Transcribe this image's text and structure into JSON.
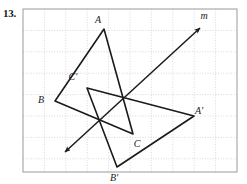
{
  "problem": {
    "number": "13."
  },
  "figure": {
    "frame": {
      "x": 23,
      "y": 9,
      "width": 214,
      "height": 163,
      "border_color": "#9a9a9a"
    },
    "grid": {
      "spacing": 21.4,
      "color": "#c9c9c9",
      "style": "dotted",
      "visible": true
    },
    "background_color": "#ffffff",
    "ink_color": "#1a1a1a",
    "labels": [
      {
        "id": "A",
        "text": "A",
        "x": 98,
        "y": 23
      },
      {
        "id": "B",
        "text": "B",
        "x": 41,
        "y": 103
      },
      {
        "id": "C",
        "text": "C",
        "x": 137,
        "y": 147
      },
      {
        "id": "Ap",
        "text": "A'",
        "x": 199,
        "y": 114
      },
      {
        "id": "Bp",
        "text": "B'",
        "x": 114,
        "y": 181
      },
      {
        "id": "Cp",
        "text": "C'",
        "x": 73,
        "y": 80
      },
      {
        "id": "m",
        "text": "m",
        "x": 204,
        "y": 19
      }
    ],
    "triangle_original": {
      "name": "triangle-ABC",
      "vertices": [
        {
          "label": "A",
          "x": 104,
          "y": 29
        },
        {
          "label": "B",
          "x": 55,
          "y": 101
        },
        {
          "label": "C",
          "x": 133,
          "y": 134
        }
      ]
    },
    "triangle_image": {
      "name": "triangle-A-prime-B-prime-C-prime",
      "vertices": [
        {
          "label": "A'",
          "x": 194,
          "y": 116
        },
        {
          "label": "B'",
          "x": 117,
          "y": 167
        },
        {
          "label": "C'",
          "x": 87,
          "y": 88
        }
      ]
    },
    "line_m": {
      "name": "line-of-reflection-m",
      "label": "m",
      "start": {
        "x": 65,
        "y": 152
      },
      "end": {
        "x": 200,
        "y": 28
      },
      "arrow_start": true,
      "arrow_end": true
    }
  }
}
